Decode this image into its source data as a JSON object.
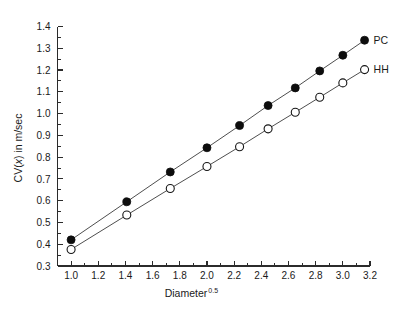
{
  "chart_data": {
    "type": "scatter",
    "title": "",
    "xlabel": "Diameter",
    "xlabel_sup": "0.5",
    "ylabel_pre": "CV(",
    "ylabel_ital": "x",
    "ylabel_post": ") in m/sec",
    "xlim": [
      0.9,
      3.2
    ],
    "ylim": [
      0.3,
      1.4
    ],
    "xticks": [
      "1.0",
      "1.2",
      "1.4",
      "1.6",
      "1.8",
      "2.0",
      "2.2",
      "2.4",
      "2.6",
      "2.8",
      "3.0",
      "3.2"
    ],
    "xtick_values": [
      1.0,
      1.2,
      1.4,
      1.6,
      1.8,
      2.0,
      2.2,
      2.4,
      2.6,
      2.8,
      3.0,
      3.2
    ],
    "yticks": [
      "0.3",
      "0.4",
      "0.5",
      "0.6",
      "0.7",
      "0.8",
      "0.9",
      "1.0",
      "1.1",
      "1.2",
      "1.3",
      "1.4"
    ],
    "ytick_values": [
      0.3,
      0.4,
      0.5,
      0.6,
      0.7,
      0.8,
      0.9,
      1.0,
      1.1,
      1.2,
      1.3,
      1.4
    ],
    "grid": false,
    "legend_position": "right-inline",
    "series": [
      {
        "name": "PC",
        "marker": "filled-circle",
        "color": "#0d0d0d",
        "x": [
          1.0,
          1.41,
          1.73,
          2.0,
          2.24,
          2.45,
          2.65,
          2.83,
          3.0,
          3.16
        ],
        "y": [
          0.42,
          0.595,
          0.732,
          0.843,
          0.945,
          1.037,
          1.118,
          1.196,
          1.268,
          1.337
        ]
      },
      {
        "name": "HH",
        "marker": "open-circle",
        "color": "#151515",
        "x": [
          1.0,
          1.41,
          1.73,
          2.0,
          2.24,
          2.45,
          2.65,
          2.83,
          3.0,
          3.16
        ],
        "y": [
          0.376,
          0.534,
          0.656,
          0.757,
          0.848,
          0.93,
          1.006,
          1.075,
          1.141,
          1.202
        ]
      }
    ]
  },
  "labels": {
    "series_pc": "PC",
    "series_hh": "HH"
  }
}
